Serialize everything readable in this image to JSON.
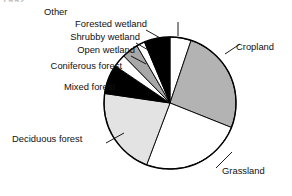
{
  "figure": {
    "corner_fragment": "1992",
    "background_color": "#ffffff",
    "outline_color": "#000000"
  },
  "chart_data": {
    "type": "pie",
    "title": "",
    "subtitle": "",
    "xlabel": "",
    "ylabel": "",
    "legend_position": "none",
    "grid": false,
    "units": "percent of area",
    "start_angle_deg": 0,
    "direction": "clockwise",
    "labels": [
      "Other",
      "Cropland",
      "Grassland",
      "Deciduous forest",
      "Mixed forest",
      "Coniferous forest",
      "Open wetland",
      "Shrubby wetland",
      "Forested wetland"
    ],
    "values": [
      5,
      25,
      24,
      21,
      7,
      3,
      4,
      2,
      6
    ],
    "angles_deg": [
      18,
      90,
      86,
      75,
      25,
      11,
      14,
      7,
      22
    ],
    "colors": [
      "#ffffff",
      "#b3b3b3",
      "#ffffff",
      "#e3e3e3",
      "#000000",
      "#ffffff",
      "#a8a8a8",
      "#ffffff",
      "#000000"
    ],
    "slices": [
      {
        "label": "Other",
        "value": 5,
        "angle_deg": 18,
        "color": "#ffffff"
      },
      {
        "label": "Cropland",
        "value": 25,
        "angle_deg": 90,
        "color": "#b3b3b3"
      },
      {
        "label": "Grassland",
        "value": 24,
        "angle_deg": 86,
        "color": "#ffffff"
      },
      {
        "label": "Deciduous forest",
        "value": 21,
        "angle_deg": 75,
        "color": "#e3e3e3"
      },
      {
        "label": "Mixed forest",
        "value": 7,
        "angle_deg": 25,
        "color": "#000000"
      },
      {
        "label": "Coniferous forest",
        "value": 3,
        "angle_deg": 11,
        "color": "#ffffff"
      },
      {
        "label": "Open wetland",
        "value": 4,
        "angle_deg": 14,
        "color": "#a8a8a8"
      },
      {
        "label": "Shrubby wetland",
        "value": 2,
        "angle_deg": 7,
        "color": "#ffffff"
      },
      {
        "label": "Forested wetland",
        "value": 6,
        "angle_deg": 22,
        "color": "#000000"
      }
    ]
  },
  "annotations": {
    "other": "Other",
    "cropland": "Cropland",
    "grassland": "Grassland",
    "deciduous_forest": "Deciduous forest",
    "mixed_forest": "Mixed forest",
    "coniferous_forest": "Coniferous forest",
    "open_wetland": "Open wetland",
    "shrubby_wetland": "Shrubby wetland",
    "forested_wetland": "Forested wetland"
  }
}
